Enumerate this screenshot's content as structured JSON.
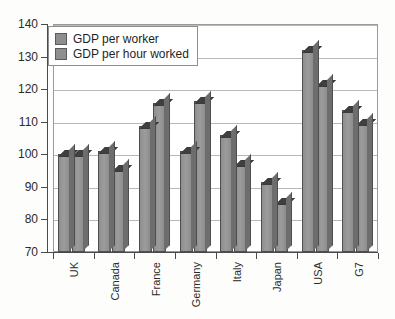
{
  "chart_data": {
    "type": "bar",
    "title": "",
    "subtitle": "",
    "xlabel": "",
    "ylabel": "",
    "ylim": [
      70,
      140
    ],
    "ytick_step": 10,
    "yticks": [
      70,
      80,
      90,
      100,
      110,
      120,
      130,
      140
    ],
    "grid": true,
    "grid_axis": "y",
    "legend_position": "top-left-inside",
    "categories": [
      "UK",
      "Canada",
      "France",
      "Germany",
      "Italy",
      "Japan",
      "USA",
      "G7"
    ],
    "series": [
      {
        "name": "GDP per worker",
        "color": "#8e8e8e",
        "values": [
          100,
          101,
          108.8,
          101,
          106,
          91.5,
          132,
          113.5
        ]
      },
      {
        "name": "GDP per hour worked",
        "color": "#8e8e8e",
        "values": [
          100,
          95.5,
          115.8,
          116.5,
          97,
          85.5,
          121.5,
          109.5
        ]
      }
    ]
  },
  "legend": {
    "entries": [
      {
        "label": "GDP per worker"
      },
      {
        "label": "GDP per hour worked"
      }
    ]
  },
  "axes": {
    "y_tick_labels": [
      "140",
      "130",
      "120",
      "110",
      "100",
      "90",
      "80",
      "70"
    ],
    "x_tick_labels": [
      "UK",
      "Canada",
      "France",
      "Germany",
      "Italy",
      "Japan",
      "USA",
      "G7"
    ]
  },
  "colors": {
    "bar_face": "#8e8e8e",
    "bar_edge": "#4f4f4f",
    "bar_top": "#3f3f3f",
    "grid": "#b9b9b9",
    "axis": "#4a4a4a",
    "frame": "#9a9a9a",
    "background": "#ffffff",
    "text": "#2b2b2b"
  }
}
